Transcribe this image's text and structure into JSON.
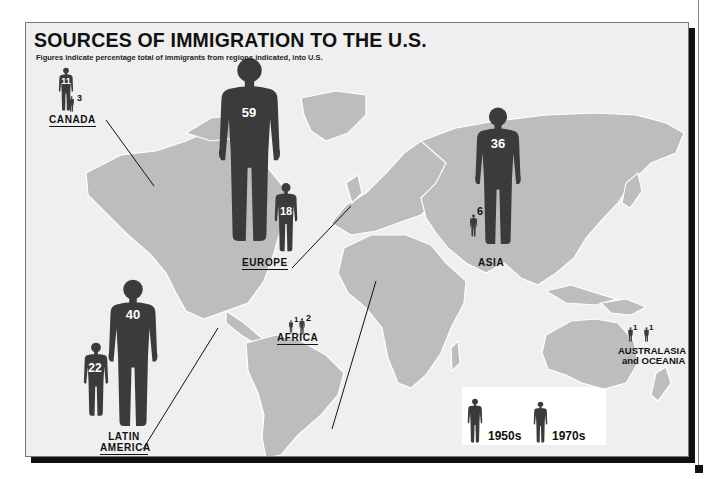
{
  "title": "SOURCES OF IMMIGRATION TO THE U.S.",
  "subtitle": "Figures indicate percentage total of immigrants from regions indicated, into U.S.",
  "colors": {
    "land": "#bdbdbd",
    "ocean": "#efefef",
    "figure": "#3b3b3b",
    "frame_shadow": "#111111"
  },
  "regions": [
    {
      "id": "canada",
      "label": "CANADA",
      "value_1950s": "11",
      "value_1970s": "3"
    },
    {
      "id": "europe",
      "label": "EUROPE",
      "value_1950s": "59",
      "value_1970s": "18"
    },
    {
      "id": "asia",
      "label": "ASIA",
      "value_1950s": "36",
      "value_1970s": "6"
    },
    {
      "id": "latin-america",
      "label_line1": "LATIN",
      "label_line2": "AMERICA",
      "value_1950s": "40",
      "value_1970s": "22"
    },
    {
      "id": "africa",
      "label": "AFRICA",
      "value_1950s": "1",
      "value_1970s": "2"
    },
    {
      "id": "australasia",
      "label_line1": "AUSTRALASIA",
      "label_line2": "and OCEANIA",
      "value_1950s": "1",
      "value_1970s": "1"
    }
  ],
  "legend": {
    "items": [
      {
        "label": "1950s",
        "icon": "person-silhouette-icon"
      },
      {
        "label": "1970s",
        "icon": "person-silhouette-icon"
      }
    ]
  }
}
